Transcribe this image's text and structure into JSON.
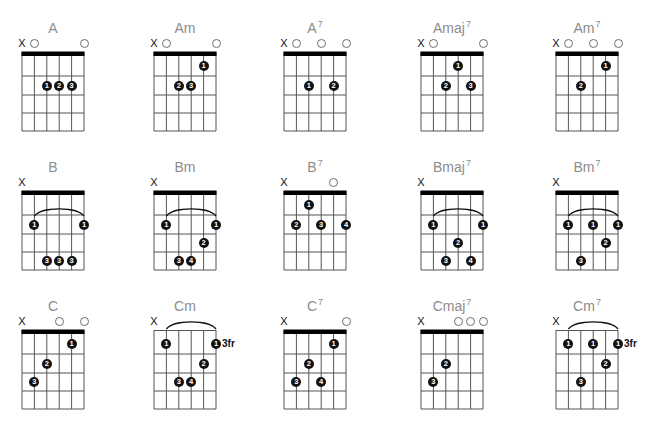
{
  "chord_chart": {
    "colors": {
      "title": "#8c8c8c",
      "grid": "#555555",
      "nut": "#000000",
      "dot": "#111111",
      "open_marker": "#6e6e6e"
    },
    "chords": [
      {
        "name": "A",
        "sup": "",
        "nut": true,
        "fret_label": "",
        "markers": [
          "X",
          "O",
          "",
          "",
          "",
          "O"
        ],
        "barre": null,
        "dots": [
          {
            "string": 3,
            "fret": 2,
            "finger": "1"
          },
          {
            "string": 4,
            "fret": 2,
            "finger": "2"
          },
          {
            "string": 5,
            "fret": 2,
            "finger": "3"
          }
        ]
      },
      {
        "name": "Am",
        "sup": "",
        "nut": true,
        "fret_label": "",
        "markers": [
          "X",
          "O",
          "",
          "",
          "",
          "O"
        ],
        "barre": null,
        "dots": [
          {
            "string": 5,
            "fret": 1,
            "finger": "1"
          },
          {
            "string": 3,
            "fret": 2,
            "finger": "2"
          },
          {
            "string": 4,
            "fret": 2,
            "finger": "3"
          }
        ]
      },
      {
        "name": "A",
        "sup": "7",
        "nut": true,
        "fret_label": "",
        "markers": [
          "X",
          "O",
          "",
          "O",
          "",
          "O"
        ],
        "barre": null,
        "dots": [
          {
            "string": 3,
            "fret": 2,
            "finger": "1"
          },
          {
            "string": 5,
            "fret": 2,
            "finger": "2"
          }
        ]
      },
      {
        "name": "Amaj",
        "sup": "7",
        "nut": true,
        "fret_label": "",
        "markers": [
          "X",
          "O",
          "",
          "",
          "",
          "O"
        ],
        "barre": null,
        "dots": [
          {
            "string": 4,
            "fret": 1,
            "finger": "1"
          },
          {
            "string": 3,
            "fret": 2,
            "finger": "2"
          },
          {
            "string": 5,
            "fret": 2,
            "finger": "3"
          }
        ]
      },
      {
        "name": "Am",
        "sup": "7",
        "nut": true,
        "fret_label": "",
        "markers": [
          "X",
          "O",
          "",
          "O",
          "",
          "O"
        ],
        "barre": null,
        "dots": [
          {
            "string": 5,
            "fret": 1,
            "finger": "1"
          },
          {
            "string": 3,
            "fret": 2,
            "finger": "2"
          }
        ]
      },
      {
        "name": "B",
        "sup": "",
        "nut": true,
        "fret_label": "",
        "markers": [
          "X",
          "",
          "",
          "",
          "",
          ""
        ],
        "barre": {
          "from": 2,
          "to": 6,
          "fret": 2
        },
        "dots": [
          {
            "string": 2,
            "fret": 2,
            "finger": "1"
          },
          {
            "string": 6,
            "fret": 2,
            "finger": "1"
          },
          {
            "string": 3,
            "fret": 4,
            "finger": "3"
          },
          {
            "string": 4,
            "fret": 4,
            "finger": "3"
          },
          {
            "string": 5,
            "fret": 4,
            "finger": "3"
          }
        ]
      },
      {
        "name": "Bm",
        "sup": "",
        "nut": true,
        "fret_label": "",
        "markers": [
          "X",
          "",
          "",
          "",
          "",
          ""
        ],
        "barre": {
          "from": 2,
          "to": 6,
          "fret": 2
        },
        "dots": [
          {
            "string": 2,
            "fret": 2,
            "finger": "1"
          },
          {
            "string": 6,
            "fret": 2,
            "finger": "1"
          },
          {
            "string": 5,
            "fret": 3,
            "finger": "2"
          },
          {
            "string": 3,
            "fret": 4,
            "finger": "3"
          },
          {
            "string": 4,
            "fret": 4,
            "finger": "4"
          }
        ]
      },
      {
        "name": "B",
        "sup": "7",
        "nut": true,
        "fret_label": "",
        "markers": [
          "X",
          "",
          "",
          "",
          "O",
          ""
        ],
        "barre": null,
        "dots": [
          {
            "string": 3,
            "fret": 1,
            "finger": "1"
          },
          {
            "string": 2,
            "fret": 2,
            "finger": "2"
          },
          {
            "string": 4,
            "fret": 2,
            "finger": "3"
          },
          {
            "string": 6,
            "fret": 2,
            "finger": "4"
          }
        ]
      },
      {
        "name": "Bmaj",
        "sup": "7",
        "nut": true,
        "fret_label": "",
        "markers": [
          "X",
          "",
          "",
          "",
          "",
          ""
        ],
        "barre": {
          "from": 2,
          "to": 6,
          "fret": 2
        },
        "dots": [
          {
            "string": 2,
            "fret": 2,
            "finger": "1"
          },
          {
            "string": 6,
            "fret": 2,
            "finger": "1"
          },
          {
            "string": 4,
            "fret": 3,
            "finger": "2"
          },
          {
            "string": 3,
            "fret": 4,
            "finger": "3"
          },
          {
            "string": 5,
            "fret": 4,
            "finger": "4"
          }
        ]
      },
      {
        "name": "Bm",
        "sup": "7",
        "nut": true,
        "fret_label": "",
        "markers": [
          "X",
          "",
          "",
          "",
          "",
          ""
        ],
        "barre": {
          "from": 2,
          "to": 6,
          "fret": 2
        },
        "dots": [
          {
            "string": 2,
            "fret": 2,
            "finger": "1"
          },
          {
            "string": 4,
            "fret": 2,
            "finger": "1"
          },
          {
            "string": 6,
            "fret": 2,
            "finger": "1"
          },
          {
            "string": 5,
            "fret": 3,
            "finger": "2"
          },
          {
            "string": 3,
            "fret": 4,
            "finger": "3"
          }
        ]
      },
      {
        "name": "C",
        "sup": "",
        "nut": true,
        "fret_label": "",
        "markers": [
          "X",
          "",
          "",
          "O",
          "",
          "O"
        ],
        "barre": null,
        "dots": [
          {
            "string": 5,
            "fret": 1,
            "finger": "1"
          },
          {
            "string": 3,
            "fret": 2,
            "finger": "2"
          },
          {
            "string": 2,
            "fret": 3,
            "finger": "3"
          }
        ]
      },
      {
        "name": "Cm",
        "sup": "",
        "nut": false,
        "fret_label": "3fr",
        "markers": [
          "X",
          "",
          "",
          "",
          "",
          ""
        ],
        "barre": {
          "from": 2,
          "to": 6,
          "fret": 1
        },
        "dots": [
          {
            "string": 2,
            "fret": 1,
            "finger": "1"
          },
          {
            "string": 6,
            "fret": 1,
            "finger": "1"
          },
          {
            "string": 5,
            "fret": 2,
            "finger": "2"
          },
          {
            "string": 3,
            "fret": 3,
            "finger": "3"
          },
          {
            "string": 4,
            "fret": 3,
            "finger": "4"
          }
        ]
      },
      {
        "name": "C",
        "sup": "7",
        "nut": true,
        "fret_label": "",
        "markers": [
          "X",
          "",
          "",
          "",
          "",
          "O"
        ],
        "barre": null,
        "dots": [
          {
            "string": 5,
            "fret": 1,
            "finger": "1"
          },
          {
            "string": 3,
            "fret": 2,
            "finger": "2"
          },
          {
            "string": 2,
            "fret": 3,
            "finger": "3"
          },
          {
            "string": 4,
            "fret": 3,
            "finger": "4"
          }
        ]
      },
      {
        "name": "Cmaj",
        "sup": "7",
        "nut": true,
        "fret_label": "",
        "markers": [
          "X",
          "",
          "",
          "O",
          "O",
          "O"
        ],
        "barre": null,
        "dots": [
          {
            "string": 3,
            "fret": 2,
            "finger": "2"
          },
          {
            "string": 2,
            "fret": 3,
            "finger": "3"
          }
        ]
      },
      {
        "name": "Cm",
        "sup": "7",
        "nut": false,
        "fret_label": "3fr",
        "markers": [
          "X",
          "",
          "",
          "",
          "",
          ""
        ],
        "barre": {
          "from": 2,
          "to": 6,
          "fret": 1
        },
        "dots": [
          {
            "string": 2,
            "fret": 1,
            "finger": "1"
          },
          {
            "string": 4,
            "fret": 1,
            "finger": "1"
          },
          {
            "string": 6,
            "fret": 1,
            "finger": "1"
          },
          {
            "string": 5,
            "fret": 2,
            "finger": "2"
          },
          {
            "string": 3,
            "fret": 3,
            "finger": "3"
          }
        ]
      }
    ]
  }
}
